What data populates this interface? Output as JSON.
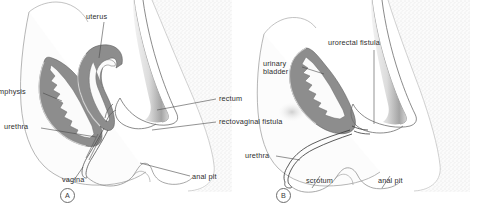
{
  "figure": {
    "type": "medical-illustration",
    "background_color": "#ffffff",
    "ink_color": "#3a3a3a",
    "tissue_fill": "#8a8a8a",
    "soft_tissue_fill": "#f4f4f4",
    "stipple_color": "#b9b9b9"
  },
  "panels": [
    {
      "id": "A",
      "letter": "A",
      "title": "female rectovaginal fistula",
      "labels": [
        {
          "name": "uterus",
          "text": "uterus"
        },
        {
          "name": "symphysis",
          "text": "mphysis"
        },
        {
          "name": "urethra",
          "text": "urethra"
        },
        {
          "name": "vagina",
          "text": "vagina"
        },
        {
          "name": "rectum",
          "text": "rectum"
        },
        {
          "name": "rectovaginal-fistula",
          "text": "rectovaginal fistula"
        },
        {
          "name": "anal-pit",
          "text": "anal pit"
        }
      ]
    },
    {
      "id": "B",
      "letter": "B",
      "title": "male urorectal fistula",
      "labels": [
        {
          "name": "urinary-bladder",
          "text": "urinary bladder"
        },
        {
          "name": "urorectal-fistula",
          "text": "urorectal  fistula"
        },
        {
          "name": "urethra",
          "text": "urethra"
        },
        {
          "name": "scrotum",
          "text": "scrotum"
        },
        {
          "name": "anal-pit",
          "text": "anal pit"
        }
      ]
    }
  ],
  "panel_a": {
    "letter": "A",
    "uterus": "uterus",
    "symphysis": "mphysis",
    "urethra": "urethra",
    "vagina": "vagina",
    "rectum": "rectum",
    "rectovaginal_fistula": "rectovaginal fistula",
    "anal_pit": "anal pit"
  },
  "panel_b": {
    "letter": "B",
    "urinary_bladder_line1": "urinary",
    "urinary_bladder_line2": "bladder",
    "urorectal_fistula": "urorectal  fistula",
    "urethra": "urethra",
    "scrotum": "scrotum",
    "anal_pit": "anal pit"
  }
}
